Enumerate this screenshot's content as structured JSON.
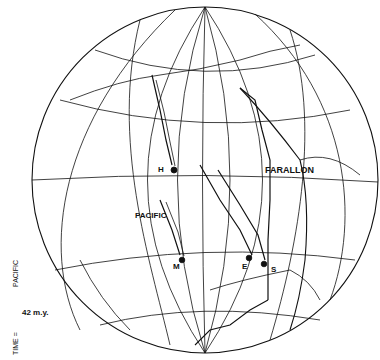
{
  "map": {
    "labels": {
      "hotspot_h": "H",
      "hotspot_m": "M",
      "hotspot_e": "E",
      "hotspot_s": "S",
      "plate_farallon": "FARALLON",
      "plate_pacific": "PACIFIC"
    },
    "caption": {
      "time_prefix": "TIME =",
      "age": "42 m.y.",
      "frame": "PACIFIC"
    },
    "colors": {
      "ink": "#111111",
      "background": "#ffffff"
    }
  }
}
